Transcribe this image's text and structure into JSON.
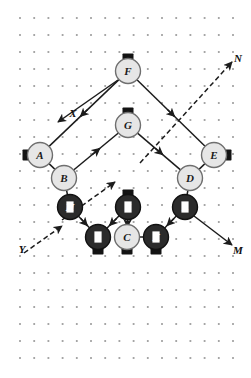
{
  "figure": {
    "width": 251,
    "height": 378,
    "background_color": "#ffffff"
  },
  "grid": {
    "dot_color": "#9c9c9c",
    "origin_x": 20,
    "origin_y": 18,
    "spacing_x": 14.2,
    "spacing_y": 17,
    "cols": 16,
    "rows": 21
  },
  "style": {
    "light_node_fill": "#e6e6e6",
    "light_node_stroke": "#6f6f6f",
    "light_node_text": "#1a1a1a",
    "dark_node_fill": "#2b2b2b",
    "dark_node_stroke": "#111111",
    "dark_node_text": "#ffffff",
    "edge_color": "#1c1c1c",
    "tab_color": "#131313",
    "node_radius": 12.5
  },
  "nodes": [
    {
      "id": "A",
      "label": "A",
      "x": 40,
      "y": 155,
      "shade": "light",
      "tab": "left"
    },
    {
      "id": "B",
      "label": "B",
      "x": 64,
      "y": 178,
      "shade": "light",
      "tab": "none"
    },
    {
      "id": "C",
      "label": "C",
      "x": 127,
      "y": 237,
      "shade": "light",
      "tab": "bottom"
    },
    {
      "id": "D",
      "label": "D",
      "x": 190,
      "y": 178,
      "shade": "light",
      "tab": "none"
    },
    {
      "id": "E",
      "label": "E",
      "x": 214,
      "y": 155,
      "shade": "light",
      "tab": "right"
    },
    {
      "id": "F",
      "label": "F",
      "x": 128,
      "y": 71,
      "shade": "light",
      "tab": "top"
    },
    {
      "id": "G",
      "label": "G",
      "x": 128,
      "y": 125,
      "shade": "light",
      "tab": "top"
    },
    {
      "id": "H",
      "label": "H",
      "x": 70,
      "y": 207,
      "shade": "dark",
      "tab": "none"
    },
    {
      "id": "I",
      "label": "I",
      "x": 98,
      "y": 237,
      "shade": "dark",
      "tab": "bottom"
    },
    {
      "id": "J",
      "label": "J",
      "x": 128,
      "y": 207,
      "shade": "dark",
      "tab": "top"
    },
    {
      "id": "K",
      "label": "K",
      "x": 156,
      "y": 237,
      "shade": "dark",
      "tab": "bottom"
    },
    {
      "id": "L",
      "label": "L",
      "x": 185,
      "y": 207,
      "shade": "dark",
      "tab": "none"
    }
  ],
  "edges": [
    {
      "from": "A",
      "to": "F",
      "style": "solid",
      "arrow": "mid-toward-from"
    },
    {
      "from": "F",
      "to": "E",
      "style": "solid",
      "arrow": "mid-toward-to"
    },
    {
      "from": "B",
      "to": "G",
      "style": "solid",
      "arrow": "mid-toward-to"
    },
    {
      "from": "G",
      "to": "D",
      "style": "solid",
      "arrow": "mid-toward-to"
    },
    {
      "from": "A",
      "to": "B",
      "style": "solid",
      "arrow": "none"
    },
    {
      "from": "D",
      "to": "E",
      "style": "solid",
      "arrow": "none"
    },
    {
      "from": "B",
      "to": "H",
      "style": "solid",
      "arrow": "none"
    },
    {
      "from": "D",
      "to": "L",
      "style": "solid",
      "arrow": "none"
    },
    {
      "from": "H",
      "to": "I",
      "style": "solid",
      "arrow": "mid-toward-to"
    },
    {
      "from": "J",
      "to": "I",
      "style": "solid",
      "arrow": "mid-toward-to"
    },
    {
      "from": "J",
      "to": "C",
      "style": "solid",
      "arrow": "mid-toward-to"
    },
    {
      "from": "L",
      "to": "K",
      "style": "solid",
      "arrow": "mid-toward-to"
    },
    {
      "from": "C",
      "to": "K",
      "style": "solid",
      "arrow": "none"
    }
  ],
  "axes": [
    {
      "id": "X",
      "label": "X",
      "label_x": 73,
      "label_y": 113,
      "style": "solid",
      "description": "solid arrow from upper-right toward lower-left passing label X"
    },
    {
      "id": "Y",
      "label": "Y",
      "label_x": 22,
      "label_y": 249,
      "style": "dashed",
      "description": "dashed arrow from lower-left toward upper-right"
    },
    {
      "id": "N",
      "label": "N",
      "label_x": 238,
      "label_y": 58,
      "style": "dashed",
      "description": "dashed arrow pointing up-right to label N"
    },
    {
      "id": "M",
      "label": "M",
      "label_x": 238,
      "label_y": 250,
      "style": "solid",
      "description": "solid arrow pointing down-right to label M"
    }
  ]
}
